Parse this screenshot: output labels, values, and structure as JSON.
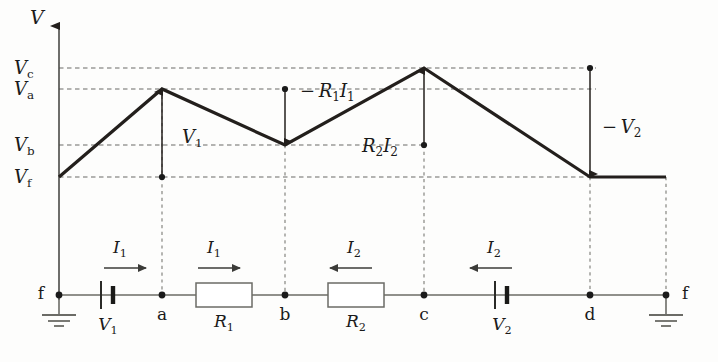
{
  "figure": {
    "type": "potential-diagram-with-circuit",
    "background_color": "#fdfdfc",
    "curve_color": "#231f1c",
    "grid_color": "#6b6b66",
    "wire_color": "#6b6b66",
    "node_color": "#1a1a1a"
  },
  "axis": {
    "v_label": "V",
    "arrow": "up-arrow-icon",
    "x_axis_start": 59,
    "y_axis_top": 18,
    "y_axis_bottom": 300
  },
  "levels": [
    {
      "key": "Vc",
      "letter": "V",
      "subscript": "c",
      "y": 68,
      "x_end": 596
    },
    {
      "key": "Va",
      "letter": "V",
      "subscript": "a",
      "y": 89,
      "x_end": 596
    },
    {
      "key": "Vb",
      "letter": "V",
      "subscript": "b",
      "y": 145,
      "x_end": 424
    },
    {
      "key": "Vf",
      "letter": "V",
      "subscript": "f",
      "y": 177,
      "x_end": 666
    }
  ],
  "potential_curve": {
    "points": [
      {
        "node": "f",
        "x": 59,
        "y": 177,
        "level": "Vf"
      },
      {
        "node": "a",
        "x": 162,
        "y": 89,
        "level": "Va"
      },
      {
        "node": "b",
        "x": 285,
        "y": 145,
        "level": "Vb"
      },
      {
        "node": "c",
        "x": 424,
        "y": 68,
        "level": "Vc"
      },
      {
        "node": "d",
        "x": 590,
        "y": 177,
        "level": "Vf"
      },
      {
        "node": "f",
        "x": 666,
        "y": 177,
        "level": "Vf"
      }
    ],
    "stroke_width": 3.2
  },
  "annotations": [
    {
      "name": "V1",
      "text_main": "V",
      "text_sub": "1",
      "sign": "",
      "label_x": 182,
      "label_y": 143,
      "arrow": {
        "x": 162,
        "y_from": 177,
        "y_to": 92,
        "direction": "up",
        "dot_at": "bottom"
      }
    },
    {
      "name": "minus-R1I1",
      "text_main": "− R₁I₁",
      "sign": "minus",
      "label_x": 300,
      "label_y": 97,
      "arrow": {
        "x": 285,
        "y_from": 89,
        "y_to": 142,
        "direction": "down",
        "dot_at": "top"
      }
    },
    {
      "name": "R2I2",
      "text_main": "R₂I₂",
      "sign": "",
      "label_x": 362,
      "label_y": 152,
      "arrow": {
        "x": 424,
        "y_from": 145,
        "y_to": 71,
        "direction": "up",
        "dot_at": "bottom"
      }
    },
    {
      "name": "minus-V2",
      "text_main": "− V₂",
      "sign": "minus",
      "label_x": 602,
      "label_y": 133,
      "arrow": {
        "x": 590,
        "y_from": 68,
        "y_to": 174,
        "direction": "down",
        "dot_at": "top"
      }
    }
  ],
  "droplines": [
    {
      "from_node": "a",
      "x": 162,
      "y_top": 89,
      "y_bottom": 295
    },
    {
      "from_node": "b",
      "x": 285,
      "y_top": 145,
      "y_bottom": 295
    },
    {
      "from_node": "c",
      "x": 424,
      "y_top": 145,
      "y_bottom": 295
    },
    {
      "from_node": "d",
      "x": 590,
      "y_top": 177,
      "y_bottom": 295
    },
    {
      "from_node": "f",
      "x": 666,
      "y_top": 177,
      "y_bottom": 295
    }
  ],
  "circuit": {
    "baseline_y": 295,
    "wire_start_x": 59,
    "wire_end_x": 666,
    "nodes": [
      {
        "label": "f",
        "x": 59,
        "label_x": 44,
        "label_y": 299,
        "label_side": "left"
      },
      {
        "label": "a",
        "x": 162,
        "label_x": 162,
        "label_y": 320,
        "label_side": "below"
      },
      {
        "label": "b",
        "x": 285,
        "label_x": 285,
        "label_y": 320,
        "label_side": "below"
      },
      {
        "label": "c",
        "x": 424,
        "label_x": 424,
        "label_y": 320,
        "label_side": "below"
      },
      {
        "label": "d",
        "x": 590,
        "label_x": 590,
        "label_y": 320,
        "label_side": "below"
      },
      {
        "label": "f",
        "x": 666,
        "label_x": 682,
        "label_y": 299,
        "label_side": "right"
      }
    ],
    "batteries": [
      {
        "name": "V1",
        "label_main": "V",
        "label_sub": "1",
        "x": 108,
        "label_x": 108,
        "label_y": 330
      },
      {
        "name": "V2",
        "label_main": "V",
        "label_sub": "2",
        "x": 502,
        "label_x": 502,
        "label_y": 330
      }
    ],
    "resistors": [
      {
        "name": "R1",
        "label_main": "R",
        "label_sub": "1",
        "x_start": 196,
        "x_end": 252,
        "label_x": 224,
        "label_y": 327
      },
      {
        "name": "R2",
        "label_main": "R",
        "label_sub": "2",
        "x_start": 328,
        "x_end": 384,
        "label_x": 356,
        "label_y": 327
      }
    ],
    "grounds": [
      {
        "name": "ground-left",
        "x": 59
      },
      {
        "name": "ground-right",
        "x": 666
      }
    ],
    "current_arrows": [
      {
        "name": "I1-battery",
        "label_main": "I",
        "label_sub": "1",
        "direction": "right",
        "x_from": 104,
        "x_to": 146,
        "y": 268,
        "label_x": 120,
        "label_y": 253
      },
      {
        "name": "I1-R1",
        "label_main": "I",
        "label_sub": "1",
        "direction": "right",
        "x_from": 198,
        "x_to": 240,
        "y": 268,
        "label_x": 214,
        "label_y": 253
      },
      {
        "name": "I2-R2",
        "label_main": "I",
        "label_sub": "2",
        "direction": "left",
        "x_from": 372,
        "x_to": 330,
        "y": 268,
        "label_x": 354,
        "label_y": 253
      },
      {
        "name": "I2-battery",
        "label_main": "I",
        "label_sub": "2",
        "direction": "left",
        "x_from": 512,
        "x_to": 470,
        "y": 268,
        "label_x": 494,
        "label_y": 253
      }
    ]
  },
  "chart_data": {
    "type": "line",
    "title": "",
    "xlabel": "",
    "ylabel": "V",
    "x_categories": [
      "f",
      "a",
      "b",
      "c",
      "d",
      "f"
    ],
    "y_tick_labels": [
      "Vc",
      "Va",
      "Vb",
      "Vf"
    ],
    "series": [
      {
        "name": "potential",
        "points": [
          {
            "x": "f",
            "level": "Vf"
          },
          {
            "x": "a",
            "level": "Va"
          },
          {
            "x": "b",
            "level": "Vb"
          },
          {
            "x": "c",
            "level": "Vc"
          },
          {
            "x": "d",
            "level": "Vf"
          },
          {
            "x": "f",
            "level": "Vf"
          }
        ]
      }
    ],
    "segment_labels": [
      "V1",
      "-R1I1",
      "R2I2",
      "-V2"
    ],
    "grid": true,
    "legend": "none"
  }
}
